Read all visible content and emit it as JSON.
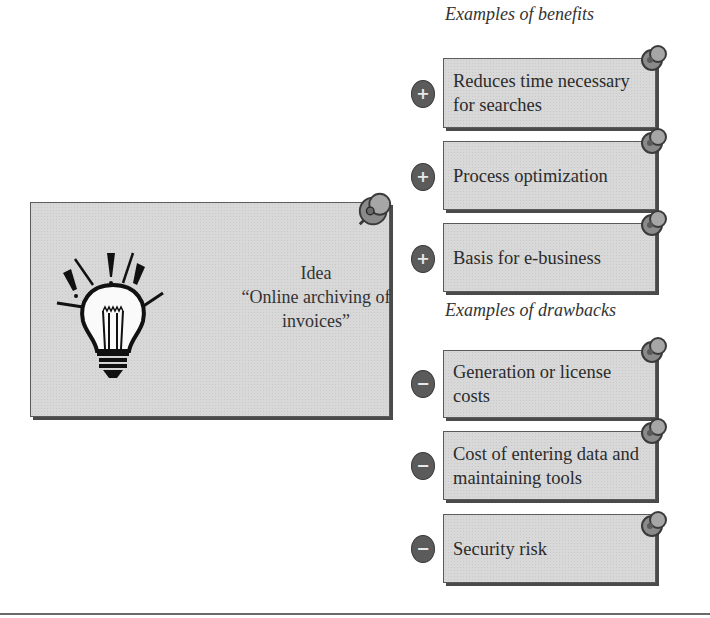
{
  "idea": {
    "line1": "Idea",
    "line2": "“Online archiving of",
    "line3": "invoices”",
    "icon": "lightbulb-icon"
  },
  "benefits": {
    "title": "Examples of benefits",
    "sign_symbol": "+",
    "items": [
      {
        "text": "Reduces time necessary for searches"
      },
      {
        "text": "Process optimization"
      },
      {
        "text": "Basis for e-business"
      }
    ]
  },
  "drawbacks": {
    "title": "Examples of drawbacks",
    "sign_symbol": "−",
    "items": [
      {
        "text": "Generation or license costs"
      },
      {
        "text": "Cost of entering data and maintaining tools"
      },
      {
        "text": "Security risk"
      }
    ]
  },
  "colors": {
    "card_fill": "#d8d8d8",
    "card_border": "#5a5a5a",
    "sign_fill": "#5b5b5b",
    "pin_fill": "#8a8a8a"
  }
}
